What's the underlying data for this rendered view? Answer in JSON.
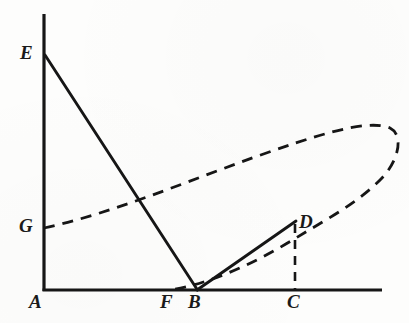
{
  "figure": {
    "kind": "geometry-diagram",
    "background_color": "#fdfdfc",
    "ink_color": "#161616",
    "width": 409,
    "height": 323,
    "labels": [
      {
        "id": "E",
        "text": "E",
        "x": 20,
        "y": 43
      },
      {
        "id": "G",
        "text": "G",
        "x": 19,
        "y": 216
      },
      {
        "id": "A",
        "text": "A",
        "x": 29,
        "y": 292
      },
      {
        "id": "F",
        "text": "F",
        "x": 160,
        "y": 292
      },
      {
        "id": "B",
        "text": "B",
        "x": 188,
        "y": 292
      },
      {
        "id": "C",
        "text": "C",
        "x": 287,
        "y": 292
      },
      {
        "id": "D",
        "text": "D",
        "x": 299,
        "y": 212
      }
    ],
    "points": {
      "A": [
        44,
        290
      ],
      "B": [
        197,
        290
      ],
      "C": [
        295,
        290
      ],
      "D": [
        295,
        222
      ],
      "E": [
        45,
        55
      ],
      "F": [
        171,
        290
      ],
      "G": [
        44,
        228
      ],
      "axis_x_end": [
        382,
        290
      ],
      "axis_y_top": [
        44,
        14
      ],
      "curve_cusp": [
        397,
        132
      ]
    },
    "strokes": {
      "axis_width": 3.2,
      "solid_width": 2.8,
      "dashed_width": 2.8,
      "dash_pattern": "11 8",
      "dash_pattern_short": "8 7"
    },
    "elements": [
      {
        "name": "y-axis",
        "style": "solid",
        "from": "A",
        "to": "axis_y_top"
      },
      {
        "name": "x-axis",
        "style": "solid",
        "from": "A",
        "to": "axis_x_end"
      },
      {
        "name": "segment-EB",
        "style": "solid",
        "from": "E",
        "to": "B"
      },
      {
        "name": "segment-BD",
        "style": "solid",
        "from": "B",
        "to": "D"
      },
      {
        "name": "segment-DC",
        "style": "dashed",
        "from": "D",
        "to": "C"
      },
      {
        "name": "curve-loop",
        "style": "dashed",
        "from": "G",
        "through": "curve_cusp",
        "to": "F"
      }
    ]
  }
}
